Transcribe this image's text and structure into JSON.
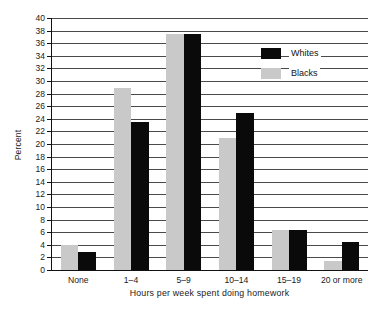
{
  "chart_data": {
    "type": "bar",
    "title": "",
    "xlabel": "Hours per week spent doing homework",
    "ylabel": "Percent",
    "categories": [
      "None",
      "1–4",
      "5–9",
      "10–14",
      "15–19",
      "20 or more"
    ],
    "series": [
      {
        "name": "Whites",
        "color": "#0a0a0a",
        "values": [
          2.8,
          23.5,
          37.5,
          24.9,
          6.4,
          4.5
        ]
      },
      {
        "name": "Blacks",
        "color": "#c9c9c9",
        "values": [
          4.0,
          28.9,
          37.5,
          21.0,
          6.3,
          1.5
        ]
      }
    ],
    "ylim": [
      0,
      40
    ],
    "ytick_step": 2,
    "yticks": [
      0,
      2,
      4,
      6,
      8,
      10,
      12,
      14,
      16,
      18,
      20,
      22,
      24,
      26,
      28,
      30,
      32,
      34,
      36,
      38,
      40
    ],
    "grid": true,
    "legend_position": "top-right",
    "bar_order_in_group": [
      "Blacks",
      "Whites"
    ]
  },
  "legend": {
    "items": [
      {
        "label": "Whites",
        "swatch": "whites"
      },
      {
        "label": "Blacks",
        "swatch": "blacks"
      }
    ]
  }
}
